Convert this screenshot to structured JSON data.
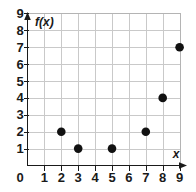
{
  "chart_data": {
    "type": "scatter",
    "title": "",
    "subtitle": "",
    "xlabel": "x",
    "ylabel": "f(x)",
    "x": [
      2,
      3,
      5,
      7,
      8,
      9
    ],
    "values": [
      2,
      1,
      1,
      2,
      4,
      7
    ],
    "points": [
      {
        "x": 2,
        "y": 2
      },
      {
        "x": 3,
        "y": 1
      },
      {
        "x": 5,
        "y": 1
      },
      {
        "x": 7,
        "y": 2
      },
      {
        "x": 8,
        "y": 4
      },
      {
        "x": 9,
        "y": 7
      }
    ],
    "xlim": [
      0,
      9.6
    ],
    "ylim": [
      0,
      9.6
    ],
    "x_ticks": [
      1,
      2,
      3,
      4,
      5,
      6,
      7,
      8,
      9
    ],
    "y_ticks": [
      1,
      2,
      3,
      4,
      5,
      6,
      7,
      8,
      9
    ],
    "origin_label": "0",
    "grid": true,
    "legend": null,
    "marker": "filled-circle",
    "marker_color": "#111111",
    "grid_color": "#c9c9c9",
    "axis_color": "#1a1a1a"
  },
  "axis": {
    "x_title": "x",
    "y_title": "f(x)",
    "origin": "0"
  },
  "x_tick_labels": [
    "1",
    "2",
    "3",
    "4",
    "5",
    "6",
    "7",
    "8",
    "9"
  ],
  "y_tick_labels": [
    "1",
    "2",
    "3",
    "4",
    "5",
    "6",
    "7",
    "8",
    "9"
  ]
}
